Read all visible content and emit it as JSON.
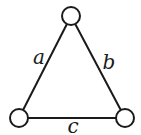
{
  "diagram": {
    "type": "triangle-graph",
    "nodes": [
      {
        "id": "top",
        "x": 71,
        "y": 16,
        "r": 9
      },
      {
        "id": "bottom-left",
        "x": 19,
        "y": 118,
        "r": 9
      },
      {
        "id": "bottom-right",
        "x": 125,
        "y": 118,
        "r": 9
      }
    ],
    "edges": [
      {
        "from": "top",
        "to": "bottom-left",
        "label": "a"
      },
      {
        "from": "top",
        "to": "bottom-right",
        "label": "b"
      },
      {
        "from": "bottom-left",
        "to": "bottom-right",
        "label": "c"
      }
    ],
    "labels": {
      "a": "a",
      "b": "b",
      "c": "c"
    },
    "colors": {
      "stroke": "#1a1a1a",
      "background": "#ffffff"
    }
  }
}
